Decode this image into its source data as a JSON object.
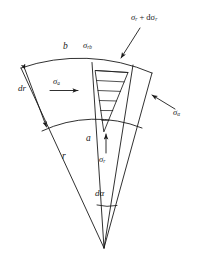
{
  "figure": {
    "stroke_color": "#1a1a1a",
    "background_color": "#ffffff",
    "labels": {
      "outer_radius": "b",
      "inner_radius": "a",
      "radius": "r",
      "radial_thickness": "dr",
      "angle_increment": "dα",
      "radial_stress": "σ",
      "radial_stress_sub": "r",
      "radial_stress_outer": "σ",
      "radial_stress_outer_sub": "rb",
      "radial_stress_increment_prefix": "σ",
      "radial_stress_increment_sub": "r",
      "radial_stress_increment_mid": " + dσ",
      "radial_stress_increment_sub2": "r",
      "axial_stress": "σ",
      "axial_stress_sub": "a",
      "hoop_stress": "σ",
      "hoop_stress_sub": "α"
    },
    "geometry": {
      "apex": [
        104,
        248
      ],
      "outer_arc_left": [
        21,
        68
      ],
      "outer_arc_right": [
        152,
        73
      ],
      "inner_arc_left": [
        42,
        131
      ],
      "inner_arc_right": [
        142,
        128
      ],
      "hatch_line_count": 6,
      "sector_angle_deg": 42
    }
  }
}
